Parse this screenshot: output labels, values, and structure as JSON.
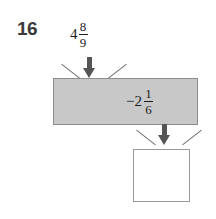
{
  "problem": {
    "number": "16",
    "type": "function-machine"
  },
  "input": {
    "whole": "4",
    "numerator": "8",
    "denominator": "9",
    "full_text": "4 8/9"
  },
  "operation": {
    "sign": "−2",
    "numerator": "1",
    "denominator": "6",
    "full_text": "−2 1/6"
  },
  "answer": {
    "value": "",
    "placeholder": ""
  },
  "icons": {
    "arrow_top": "arrow-down-icon",
    "arrow_bottom": "arrow-down-icon"
  },
  "colors": {
    "bar_fill": "#c8c8c8",
    "bar_border": "#8c8c8c",
    "arrow": "#555555",
    "tick": "#6f6f6f",
    "text": "#1c1c1c",
    "number": "#3b3b3b",
    "answer_border": "#9a9a9a"
  }
}
